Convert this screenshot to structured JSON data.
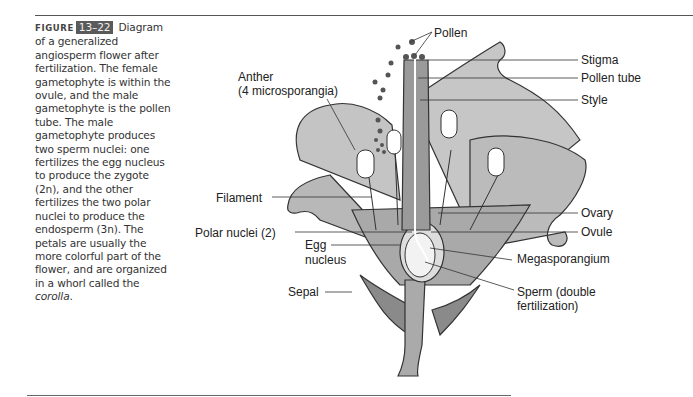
{
  "figure": {
    "label_word": "FIGURE",
    "number": "13–22",
    "caption_parts": {
      "lead": " Diagram of a generalized angiosperm flower after fertilization. The female gametophyte is within the ovule, and the male gametophyte is the pollen tube. The male gametophyte produces two sperm nuclei: one fertilizes the egg nucleus to produce the zygote (2n), and the other fertilizes the two polar nuclei to produce the endosperm (3n). The petals are usually the more colorful part of the flower, and are organized in a whorl called the ",
      "emph": "corolla",
      "tail": "."
    }
  },
  "diagram": {
    "labels": {
      "pollen": "Pollen",
      "stigma": "Stigma",
      "pollen_tube": "Pollen tube",
      "style": "Style",
      "anther_line1": "Anther",
      "anther_line2": "(4 microsporangia)",
      "filament": "Filament",
      "ovary": "Ovary",
      "ovule": "Ovule",
      "polar_nuclei": "Polar nuclei (2)",
      "egg_line1": "Egg",
      "egg_line2": "nucleus",
      "megasporangium": "Megasporangium",
      "sepal": "Sepal",
      "sperm_line1": "Sperm (double",
      "sperm_line2": "fertilization)"
    },
    "colors": {
      "petal_fill": "#bdbdbd",
      "inner_fill": "#9e9e9e",
      "sepal_fill": "#8a8a8a",
      "stem_fill": "#a8a8a8",
      "ovule_fill": "#eeeeee",
      "outline": "#333333",
      "pollen_dot": "#555555"
    }
  }
}
